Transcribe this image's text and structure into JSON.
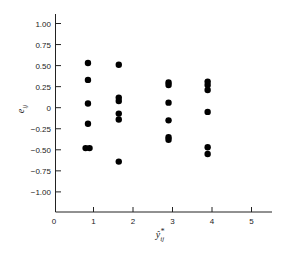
{
  "chart_data": {
    "type": "scatter",
    "title": "",
    "xlabel": "ŷ*ij",
    "ylabel": "eij",
    "xlim": [
      0,
      5.5
    ],
    "ylim": [
      -1.25,
      1.12
    ],
    "x_ticks": [
      0,
      1,
      2,
      3,
      4,
      5
    ],
    "x_tick_labels": [
      "0",
      "1",
      "2",
      "3",
      "4",
      "5"
    ],
    "y_ticks": [
      1.0,
      0.75,
      0.5,
      0.25,
      0,
      -0.25,
      -0.5,
      -0.75,
      -1.0
    ],
    "y_tick_labels": [
      "1.00",
      "0.75",
      "0.50",
      "0.25",
      "0",
      "−0.25",
      "−0.50",
      "−0.75",
      "−1.00"
    ],
    "grid": false,
    "legend": null,
    "series": [
      {
        "name": "residuals",
        "color": "#000000",
        "points": [
          {
            "x": 0.86,
            "y": 0.53
          },
          {
            "x": 0.86,
            "y": 0.33
          },
          {
            "x": 0.86,
            "y": 0.05
          },
          {
            "x": 0.86,
            "y": -0.19
          },
          {
            "x": 0.8,
            "y": -0.48
          },
          {
            "x": 0.9,
            "y": -0.48
          },
          {
            "x": 1.64,
            "y": 0.51
          },
          {
            "x": 1.64,
            "y": 0.12
          },
          {
            "x": 1.64,
            "y": 0.08
          },
          {
            "x": 1.64,
            "y": -0.07
          },
          {
            "x": 1.64,
            "y": -0.14
          },
          {
            "x": 1.64,
            "y": -0.64
          },
          {
            "x": 2.9,
            "y": 0.3
          },
          {
            "x": 2.9,
            "y": 0.27
          },
          {
            "x": 2.9,
            "y": 0.06
          },
          {
            "x": 2.9,
            "y": -0.15
          },
          {
            "x": 2.9,
            "y": -0.35
          },
          {
            "x": 2.9,
            "y": -0.38
          },
          {
            "x": 3.89,
            "y": 0.31
          },
          {
            "x": 3.89,
            "y": 0.27
          },
          {
            "x": 3.89,
            "y": 0.21
          },
          {
            "x": 3.89,
            "y": -0.05
          },
          {
            "x": 3.89,
            "y": -0.47
          },
          {
            "x": 3.89,
            "y": -0.55
          }
        ]
      }
    ]
  }
}
